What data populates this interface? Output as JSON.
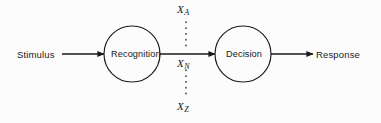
{
  "diagram": {
    "background_color": "#fcfcfc",
    "stroke_color": "#1a1a1a",
    "nodes": [
      {
        "id": "recognition",
        "label": "Recognition",
        "shape": "circle",
        "cx": 132,
        "cy": 54,
        "r": 28
      },
      {
        "id": "decision",
        "label": "Decision",
        "shape": "circle",
        "cx": 243,
        "cy": 54,
        "r": 28
      }
    ],
    "endpoints": {
      "input_label": "Stimulus",
      "output_label": "Response"
    },
    "arrows": [
      {
        "id": "stimulus-to-recognition",
        "from": "Stimulus",
        "to": "Recognition",
        "x1": 62,
        "x2": 104,
        "y": 54
      },
      {
        "id": "recognition-to-decision",
        "from": "Recognition",
        "to": "Decision",
        "x1": 160,
        "x2": 215,
        "y": 54
      },
      {
        "id": "decision-to-response",
        "from": "Decision",
        "to": "Response",
        "x1": 271,
        "x2": 313,
        "y": 54
      }
    ],
    "dotted_connector": {
      "id": "variable-axis",
      "x": 186,
      "y_top": 22,
      "y_bottom": 98,
      "style": "dotted"
    },
    "variables": [
      {
        "id": "x-a",
        "base": "X",
        "subscript": "A",
        "text": "XA",
        "position": "top"
      },
      {
        "id": "x-n",
        "base": "X",
        "subscript": "N",
        "text": "XN",
        "position": "middle"
      },
      {
        "id": "x-z",
        "base": "X",
        "subscript": "Z",
        "text": "XZ",
        "position": "bottom"
      }
    ]
  }
}
